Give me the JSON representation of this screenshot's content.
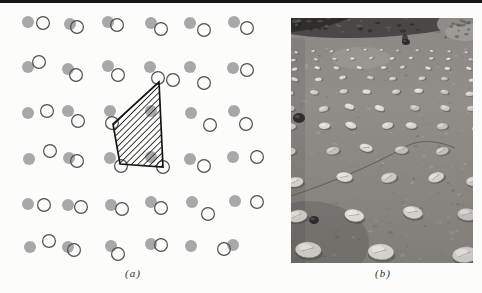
{
  "page": {
    "top_rule_color": "#161616",
    "background": "#fcfcfa"
  },
  "panel_a": {
    "label": "(a)",
    "atom_radius": 6,
    "displaced_radius": 6.4,
    "displaced_stroke_width": 1.2,
    "cell_stroke_width": 1.7,
    "hatch_spacing": 4.5,
    "colors": {
      "atom_fill": "#a8a8a8",
      "displaced_stroke": "#4f4f4f",
      "cell_stroke": "#161616",
      "hatch_line": "#2a2a2a"
    },
    "lattice_atoms": [
      [
        28,
        22
      ],
      [
        70,
        24
      ],
      [
        108,
        22
      ],
      [
        151,
        23
      ],
      [
        190,
        23
      ],
      [
        234,
        22
      ],
      [
        28,
        67
      ],
      [
        68,
        69
      ],
      [
        108,
        66
      ],
      [
        150,
        67
      ],
      [
        190,
        67
      ],
      [
        233,
        68
      ],
      [
        28,
        113
      ],
      [
        68,
        111
      ],
      [
        110,
        111
      ],
      [
        151,
        111
      ],
      [
        191,
        113
      ],
      [
        234,
        111
      ],
      [
        29,
        159
      ],
      [
        69,
        158
      ],
      [
        110,
        158
      ],
      [
        151,
        157
      ],
      [
        190,
        159
      ],
      [
        233,
        157
      ],
      [
        28,
        204
      ],
      [
        68,
        205
      ],
      [
        111,
        205
      ],
      [
        151,
        202
      ],
      [
        192,
        202
      ],
      [
        235,
        201
      ],
      [
        30,
        247
      ],
      [
        68,
        247
      ],
      [
        111,
        246
      ],
      [
        151,
        244
      ],
      [
        191,
        246
      ],
      [
        233,
        245
      ]
    ],
    "displaced_atoms": [
      [
        43,
        23
      ],
      [
        77,
        27
      ],
      [
        117,
        25
      ],
      [
        161,
        29
      ],
      [
        204,
        30
      ],
      [
        247,
        28
      ],
      [
        39,
        62
      ],
      [
        76,
        75
      ],
      [
        118,
        75
      ],
      [
        158,
        78
      ],
      [
        173,
        80
      ],
      [
        204,
        83
      ],
      [
        247,
        70
      ],
      [
        47,
        111
      ],
      [
        78,
        121
      ],
      [
        112,
        123
      ],
      [
        210,
        125
      ],
      [
        246,
        124
      ],
      [
        50,
        151
      ],
      [
        77,
        161
      ],
      [
        121,
        166
      ],
      [
        163,
        167
      ],
      [
        204,
        166
      ],
      [
        257,
        157
      ],
      [
        44,
        205
      ],
      [
        81,
        207
      ],
      [
        122,
        209
      ],
      [
        161,
        208
      ],
      [
        208,
        214
      ],
      [
        257,
        202
      ],
      [
        49,
        241
      ],
      [
        74,
        250
      ],
      [
        118,
        254
      ],
      [
        161,
        245
      ],
      [
        224,
        249
      ]
    ],
    "unit_cell": [
      [
        159,
        82
      ],
      [
        113,
        124
      ],
      [
        120,
        164
      ],
      [
        163,
        167
      ]
    ]
  },
  "panel_b": {
    "label": "(b)",
    "photo": {
      "width": 182,
      "height": 245,
      "colors": {
        "mud_top": "#8b8885",
        "mud_mid": "#918e8a",
        "mud_bottom": "#817e7a",
        "band_dark": "#4a4846",
        "band_darker": "#2c2b29",
        "mound_fill": "#8f8c88",
        "mound_light": "#a09d98",
        "patch_light": "#a3a09b",
        "crack": "#52504d",
        "shadow": "#3e3c3a",
        "rock_dark": "#262523",
        "stone_palette": [
          "#cbc8c3",
          "#d4d1cc",
          "#c2bfba",
          "#dcd9d4"
        ]
      },
      "band_path": "M0,0 H182 V7 C155,12 125,17 92,19 C55,21 20,20 0,16 Z",
      "band_dark_path": "M0,0 H60 C40,8 20,12 0,14 Z",
      "mound": {
        "cx": 170,
        "cy": 6,
        "rx": 24,
        "ry": 13
      },
      "mound_inner": {
        "cx": 174,
        "cy": 14,
        "rx": 20,
        "ry": 9
      },
      "light_patch": {
        "cx": 70,
        "cy": 40,
        "rx": 30,
        "ry": 11
      },
      "center_dark_spot": {
        "cx": 114,
        "cy": 21,
        "rx": 3,
        "ry": 5
      },
      "crack_path": "M0,178 C30,168 78,150 116,128 C132,120 150,124 164,130",
      "stone_rows": [
        {
          "y": 34,
          "count": 11,
          "rx": 2.0,
          "ry": 1.1,
          "x0": 6,
          "x1": 176,
          "bow": 2
        },
        {
          "y": 42,
          "count": 10,
          "rx": 2.5,
          "ry": 1.4,
          "x0": 4,
          "x1": 178,
          "bow": 2
        },
        {
          "y": 51,
          "count": 9,
          "rx": 3.0,
          "ry": 1.7,
          "x0": 3,
          "x1": 179,
          "bow": 2
        },
        {
          "y": 62,
          "count": 8,
          "rx": 3.6,
          "ry": 2.0,
          "x0": 2,
          "x1": 180,
          "bow": 2
        },
        {
          "y": 75,
          "count": 8,
          "rx": 4.3,
          "ry": 2.4,
          "x0": 0,
          "x1": 181,
          "bow": 2
        },
        {
          "y": 91,
          "count": 7,
          "rx": 5.0,
          "ry": 2.9,
          "x0": 0,
          "x1": 182,
          "bow": 2
        },
        {
          "y": 110,
          "count": 7,
          "rx": 5.8,
          "ry": 3.4,
          "x0": 1,
          "x1": 184,
          "bow": 2
        },
        {
          "y": 133,
          "count": 6,
          "rx": 6.8,
          "ry": 4.0,
          "x0": 2,
          "x1": 186,
          "bow": 2
        },
        {
          "y": 162,
          "count": 5,
          "rx": 8.2,
          "ry": 5.0,
          "x0": 2,
          "x1": 186,
          "bow": 3
        },
        {
          "y": 198,
          "count": 4,
          "rx": 10.0,
          "ry": 6.2,
          "x0": 6,
          "x1": 182,
          "bow": 3
        },
        {
          "y": 233,
          "count": 3,
          "rx": 13.0,
          "ry": 8.0,
          "x0": 12,
          "x1": 176,
          "bow": 2
        }
      ],
      "dark_rocks": [
        {
          "x": 8,
          "y": 100,
          "rx": 6,
          "ry": 5
        },
        {
          "x": 23,
          "y": 202,
          "rx": 5,
          "ry": 4
        },
        {
          "x": 115,
          "y": 24,
          "rx": 4,
          "ry": 3
        }
      ]
    }
  }
}
